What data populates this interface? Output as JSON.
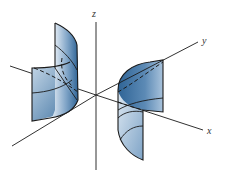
{
  "figure": {
    "type": "3d-surface-diagram",
    "axes": {
      "x": {
        "label": "x"
      },
      "y": {
        "label": "y"
      },
      "z": {
        "label": "z"
      }
    },
    "colors": {
      "surface_dark": "#2f6496",
      "surface_light": "#dde8f2",
      "line": "#1a1a1a",
      "background": "#ffffff"
    }
  }
}
